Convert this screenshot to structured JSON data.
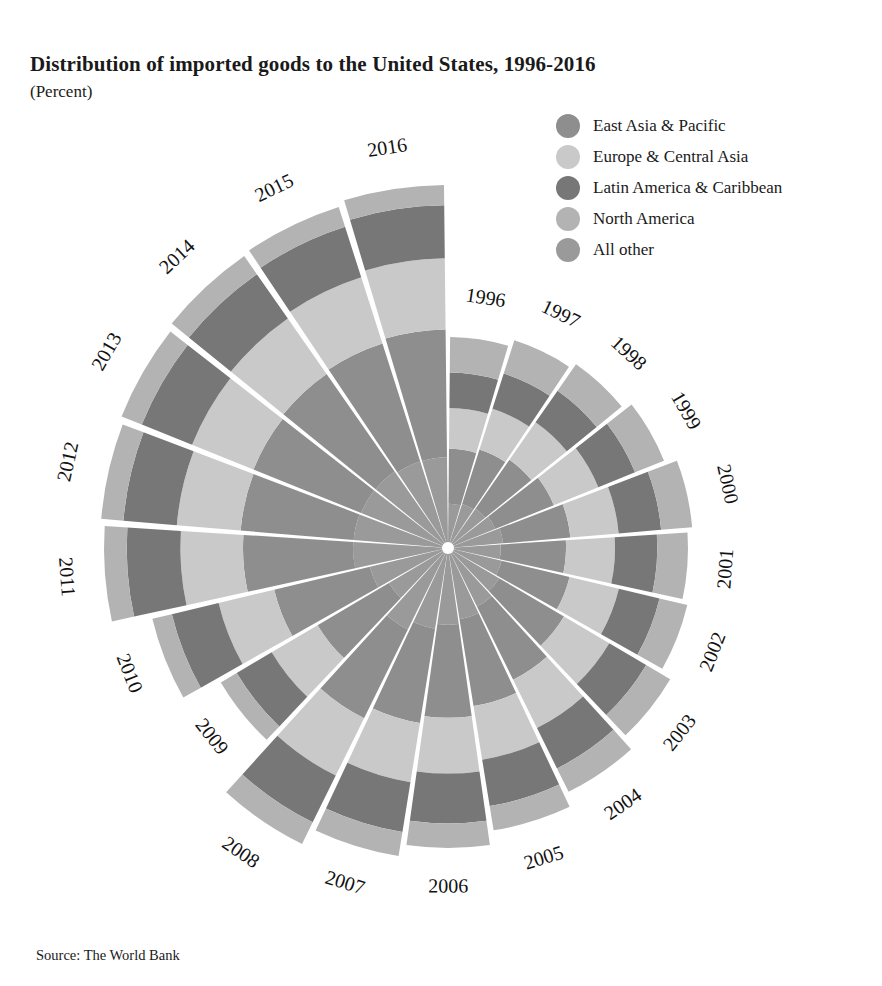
{
  "title": "Distribution of imported goods to the United States, 1996-2016",
  "subtitle": "(Percent)",
  "source": "Source: The World Bank",
  "legend": {
    "position": "top-right",
    "items": [
      {
        "label": "East Asia & Pacific",
        "color": "#8e8e8e"
      },
      {
        "label": "Europe & Central Asia",
        "color": "#c9c9c9"
      },
      {
        "label": "Latin America & Caribbean",
        "color": "#777777"
      },
      {
        "label": "North America",
        "color": "#b3b3b3"
      },
      {
        "label": "All other",
        "color": "#9a9a9a"
      }
    ]
  },
  "chart_data": {
    "type": "pie",
    "variant": "polar-stacked-area",
    "title": "Distribution of imported goods to the United States, 1996-2016",
    "subtitle": "(Percent)",
    "xlabel": "",
    "ylabel": "Percent",
    "grid": false,
    "legend_position": "top-right",
    "note": "Each wedge is one year; radius encodes total import value, bands are percent shares stacked from center outward.",
    "categories": [
      "1996",
      "1997",
      "1998",
      "1999",
      "2000",
      "2001",
      "2002",
      "2003",
      "2004",
      "2005",
      "2006",
      "2007",
      "2008",
      "2009",
      "2010",
      "2011",
      "2012",
      "2013",
      "2014",
      "2015",
      "2016"
    ],
    "series": [
      {
        "name": "All other",
        "color": "#9a9a9a",
        "values": [
          21.0,
          21.2,
          21.4,
          21.8,
          22.5,
          22.0,
          22.4,
          23.0,
          24.0,
          25.2,
          25.6,
          26.2,
          27.5,
          26.0,
          26.4,
          27.6,
          27.2,
          26.6,
          26.2,
          25.4,
          25.0
        ]
      },
      {
        "name": "East Asia & Pacific",
        "color": "#8e8e8e",
        "values": [
          26.0,
          26.2,
          26.6,
          27.2,
          27.6,
          27.2,
          28.4,
          29.2,
          30.0,
          30.8,
          31.0,
          30.6,
          30.0,
          31.4,
          32.4,
          32.0,
          32.6,
          33.0,
          33.4,
          34.6,
          35.2
        ]
      },
      {
        "name": "Europe & Central Asia",
        "color": "#c9c9c9",
        "values": [
          19.4,
          19.6,
          20.4,
          20.6,
          19.8,
          20.4,
          20.6,
          20.4,
          19.8,
          19.0,
          18.6,
          19.2,
          19.4,
          20.2,
          18.8,
          18.2,
          18.4,
          18.8,
          19.0,
          19.4,
          19.6
        ]
      },
      {
        "name": "Latin America & Caribbean",
        "color": "#777777",
        "values": [
          16.8,
          17.0,
          17.2,
          17.0,
          17.4,
          17.6,
          17.0,
          16.6,
          16.6,
          16.4,
          16.6,
          16.2,
          15.8,
          15.4,
          15.8,
          15.6,
          15.4,
          15.4,
          15.2,
          14.8,
          14.6
        ]
      },
      {
        "name": "North America",
        "color": "#b3b3b3",
        "values": [
          16.8,
          16.0,
          14.4,
          13.4,
          12.7,
          12.8,
          11.6,
          10.8,
          9.6,
          8.6,
          8.2,
          7.8,
          7.3,
          7.0,
          6.6,
          6.6,
          6.4,
          6.2,
          6.2,
          5.8,
          5.6
        ]
      }
    ],
    "radius_values": [
      211,
      218,
      224,
      233,
      245,
      240,
      246,
      258,
      272,
      286,
      300,
      312,
      330,
      264,
      304,
      344,
      348,
      352,
      356,
      358,
      363
    ],
    "radius_unit": "px (encodes total import value)",
    "angles": {
      "start_deg": 0,
      "sweep_per_wedge_deg": 17.14,
      "direction": "clockwise-from-top"
    }
  }
}
